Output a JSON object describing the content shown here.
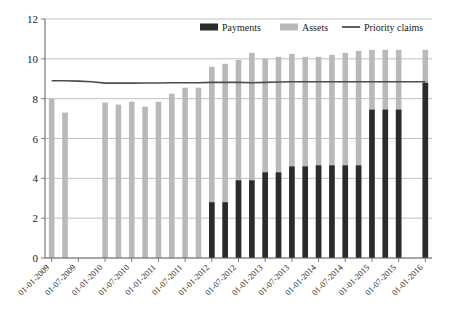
{
  "chart_data": {
    "type": "bar",
    "title": "",
    "subtitle": "",
    "xlabel": "",
    "ylabel": "",
    "ylim": [
      0,
      12
    ],
    "yticks": [
      0,
      2,
      4,
      6,
      8,
      10,
      12
    ],
    "grid": true,
    "legend_position": "top-center",
    "legend": [
      "Payments",
      "Assets",
      "Priority claims"
    ],
    "colors": {
      "payments": "#2b2b2b",
      "assets": "#b9b9b9",
      "priority_claims": "#4d4d4d",
      "grid": "#b0b0b0",
      "axis": "#6e6e6e",
      "background": "#ffffff"
    },
    "categories": [
      "01-01-2009",
      "01-04-2009",
      "01-07-2009",
      "01-10-2009",
      "01-01-2010",
      "01-04-2010",
      "01-07-2010",
      "01-10-2010",
      "01-01-2011",
      "01-04-2011",
      "01-07-2011",
      "01-10-2011",
      "01-01-2012",
      "01-04-2012",
      "01-07-2012",
      "01-10-2012",
      "01-01-2013",
      "01-04-2013",
      "01-07-2013",
      "01-10-2013",
      "01-01-2014",
      "01-04-2014",
      "01-07-2014",
      "01-10-2014",
      "01-01-2015",
      "01-04-2015",
      "01-07-2015",
      "01-10-2015",
      "01-01-2016"
    ],
    "xtick_labels": [
      "01-01-2009",
      "01-07-2009",
      "01-01-2010",
      "01-07-2010",
      "01-01-2011",
      "01-07-2011",
      "01-01-2012",
      "01-07-2012",
      "01-01-2013",
      "01-07-2013",
      "01-01-2014",
      "01-07-2014",
      "01-01-2015",
      "01-07-2015",
      "01-01-2016"
    ],
    "series": [
      {
        "name": "Assets",
        "type": "bar",
        "color": "#b9b9b9",
        "values": [
          8.0,
          7.3,
          null,
          null,
          7.8,
          7.7,
          7.85,
          7.6,
          7.85,
          8.25,
          8.55,
          8.55,
          9.6,
          9.75,
          9.95,
          10.3,
          10.0,
          10.1,
          10.25,
          10.1,
          10.1,
          10.2,
          10.3,
          10.4,
          10.45,
          10.45,
          10.45,
          null,
          10.45
        ]
      },
      {
        "name": "Payments",
        "type": "bar",
        "color": "#2b2b2b",
        "values": [
          null,
          null,
          null,
          null,
          null,
          null,
          null,
          null,
          null,
          null,
          null,
          null,
          2.8,
          2.8,
          3.9,
          3.9,
          4.3,
          4.3,
          4.6,
          4.6,
          4.65,
          4.65,
          4.65,
          4.65,
          7.45,
          7.45,
          7.45,
          null,
          8.8
        ]
      },
      {
        "name": "Priority claims",
        "type": "line",
        "color": "#4d4d4d",
        "values": [
          8.9,
          8.9,
          8.88,
          8.85,
          8.78,
          8.78,
          8.78,
          8.79,
          8.79,
          8.8,
          8.8,
          8.8,
          8.82,
          8.82,
          8.82,
          8.8,
          8.82,
          8.84,
          8.85,
          8.85,
          8.85,
          8.85,
          8.85,
          8.85,
          8.85,
          8.85,
          8.85,
          8.85,
          8.85
        ]
      }
    ]
  }
}
